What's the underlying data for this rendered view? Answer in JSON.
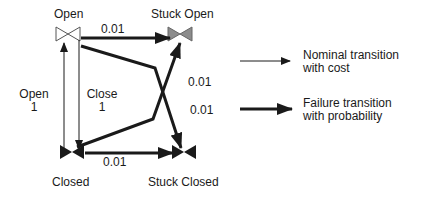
{
  "states": {
    "open": {
      "label": "Open",
      "fill": "#ffffff"
    },
    "stuck_open": {
      "label": "Stuck Open",
      "fill": "#8c8c8c"
    },
    "closed": {
      "label": "Closed",
      "fill": "#1a1a1a"
    },
    "stuck_closed": {
      "label": "Stuck Closed",
      "fill": "#1a1a1a"
    }
  },
  "transitions": {
    "open_to_stuck_open": {
      "label": "0.01",
      "type": "failure"
    },
    "closed_to_stuck_closed": {
      "label": "0.01",
      "type": "failure"
    },
    "closed_to_stuck_open": {
      "label": "0.01",
      "type": "failure"
    },
    "open_to_stuck_closed": {
      "label": "0.01",
      "type": "failure"
    },
    "closed_to_open": {
      "label_line1": "Open",
      "label_line2": "1",
      "type": "nominal"
    },
    "open_to_closed": {
      "label_line1": "Close",
      "label_line2": "1",
      "type": "nominal"
    }
  },
  "legend": {
    "nominal": {
      "line1": "Nominal transition",
      "line2": "with cost"
    },
    "failure": {
      "line1": "Failure transition",
      "line2": "with probability"
    }
  }
}
